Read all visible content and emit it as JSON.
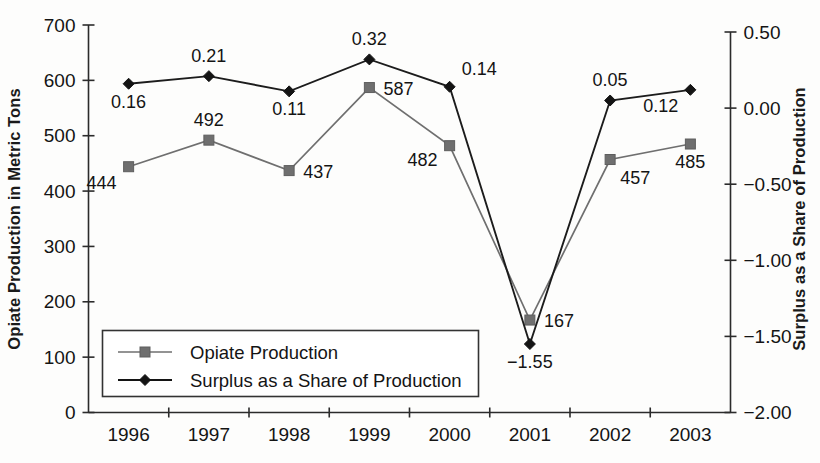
{
  "chart_data": {
    "type": "line",
    "title": "",
    "xlabel": "",
    "ylabel": "Opiate Production in Metric Tons",
    "y2label": "Surplus as a Share of Production",
    "categories": [
      "1996",
      "1997",
      "1998",
      "1999",
      "2000",
      "2001",
      "2002",
      "2003"
    ],
    "ylim": [
      0,
      700
    ],
    "yticks": [
      "0",
      "100",
      "200",
      "300",
      "400",
      "500",
      "600",
      "700"
    ],
    "ytick_values": [
      0,
      100,
      200,
      300,
      400,
      500,
      600,
      700
    ],
    "y2lim": [
      -2.0,
      0.5
    ],
    "y2ticks": [
      "−2.00",
      "−1.50",
      "−1.00",
      "−0.50",
      "0.00",
      "0.50"
    ],
    "y2tick_values": [
      -2.0,
      -1.5,
      -1.0,
      -0.5,
      0.0,
      0.5
    ],
    "grid": false,
    "legend_position": "lower-left-inside",
    "series": [
      {
        "name": "Opiate Production",
        "axis": "left",
        "marker": "square",
        "color": "#6f6f6f",
        "values": [
          444,
          492,
          437,
          587,
          482,
          167,
          457,
          485
        ],
        "labels": [
          "444",
          "492",
          "437",
          "587",
          "482",
          "167",
          "457",
          "485"
        ],
        "label_positions": [
          "below-left",
          "above",
          "right",
          "right",
          "left",
          "right",
          "below-right",
          "below"
        ]
      },
      {
        "name": "Surplus as a Share of Production",
        "axis": "right",
        "marker": "diamond",
        "color": "#141414",
        "values": [
          0.16,
          0.21,
          0.11,
          0.32,
          0.14,
          -1.55,
          0.05,
          0.12
        ],
        "labels": [
          "0.16",
          "0.21",
          "0.11",
          "0.32",
          "0.14",
          "−1.55",
          "0.05",
          "0.12"
        ],
        "label_positions": [
          "below",
          "above",
          "below",
          "above",
          "above-right",
          "below",
          "above",
          "below-left"
        ]
      }
    ]
  },
  "legend": {
    "entries": [
      {
        "label": "Opiate Production",
        "marker": "square",
        "color": "#6f6f6f"
      },
      {
        "label": "Surplus as a Share of Production",
        "marker": "diamond",
        "color": "#141414"
      }
    ]
  },
  "colors": {
    "production": "#6f6f6f",
    "surplus": "#141414",
    "axis": "#2b2b2b",
    "background": "#fdfdfc"
  }
}
